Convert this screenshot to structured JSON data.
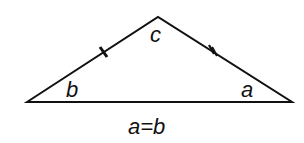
{
  "diagram": {
    "type": "isosceles-triangle",
    "vertices": {
      "left": [
        27,
        102
      ],
      "apex": [
        158,
        17
      ],
      "right": [
        292,
        102
      ]
    },
    "angle_labels": {
      "apex": "c",
      "left": "b",
      "right": "a"
    },
    "side_marks": {
      "left_side": "single tick",
      "right_side": "double tick"
    },
    "caption": "a=b",
    "stroke_color": "#111111",
    "background": "#ffffff"
  }
}
